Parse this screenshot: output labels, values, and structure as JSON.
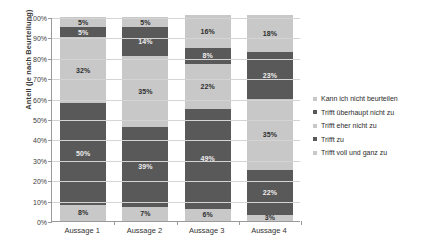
{
  "chart_data": {
    "type": "bar",
    "stacked": true,
    "title": "",
    "xlabel": "",
    "ylabel": "Anteil (je nach Beurteilung)",
    "ylim": [
      0,
      100
    ],
    "ytick_labels": [
      "100%",
      "90%",
      "80%",
      "70%",
      "60%",
      "50%",
      "40%",
      "30%",
      "20%",
      "10%",
      "0%"
    ],
    "ytick_values": [
      100,
      90,
      80,
      70,
      60,
      50,
      40,
      30,
      20,
      10,
      0
    ],
    "grid": true,
    "legend_position": "right",
    "categories": [
      "Aussage 1",
      "Aussage 2",
      "Aussage 3",
      "Aussage 4"
    ],
    "series": [
      {
        "name": "Trifft voll und ganz zu",
        "color": "#c8c8c8",
        "shade": "light",
        "values": [
          8,
          7,
          6,
          3
        ],
        "labels": [
          "8%",
          "7%",
          "6%",
          "3%"
        ]
      },
      {
        "name": "Trifft zu",
        "color": "#595959",
        "shade": "dark",
        "values": [
          50,
          39,
          49,
          22
        ],
        "labels": [
          "50%",
          "39%",
          "49%",
          "22%"
        ]
      },
      {
        "name": "Trifft eher nicht zu",
        "color": "#c8c8c8",
        "shade": "light",
        "values": [
          32,
          35,
          22,
          35
        ],
        "labels": [
          "32%",
          "35%",
          "22%",
          "35%"
        ]
      },
      {
        "name": "Trifft überhaupt nicht zu",
        "color": "#595959",
        "shade": "dark",
        "values": [
          5,
          14,
          8,
          23
        ],
        "labels": [
          "5%",
          "14%",
          "8%",
          "23%"
        ]
      },
      {
        "name": "Kann ich nicht beurteilen",
        "color": "#c8c8c8",
        "shade": "light",
        "values": [
          5,
          5,
          16,
          18
        ],
        "labels": [
          "5%",
          "5%",
          "16%",
          "18%"
        ]
      }
    ],
    "legend_entries": [
      {
        "label": "Kann ich nicht beurteilen",
        "shade": "light"
      },
      {
        "label": "Trifft überhaupt nicht zu",
        "shade": "dark"
      },
      {
        "label": "Trifft eher nicht zu",
        "shade": "light"
      },
      {
        "label": "Trifft zu",
        "shade": "dark"
      },
      {
        "label": "Trifft voll und ganz zu",
        "shade": "light"
      }
    ],
    "colors": {
      "light": "#c8c8c8",
      "dark": "#595959",
      "axis": "#9a9a9a",
      "grid": "#d4d4d4"
    }
  }
}
